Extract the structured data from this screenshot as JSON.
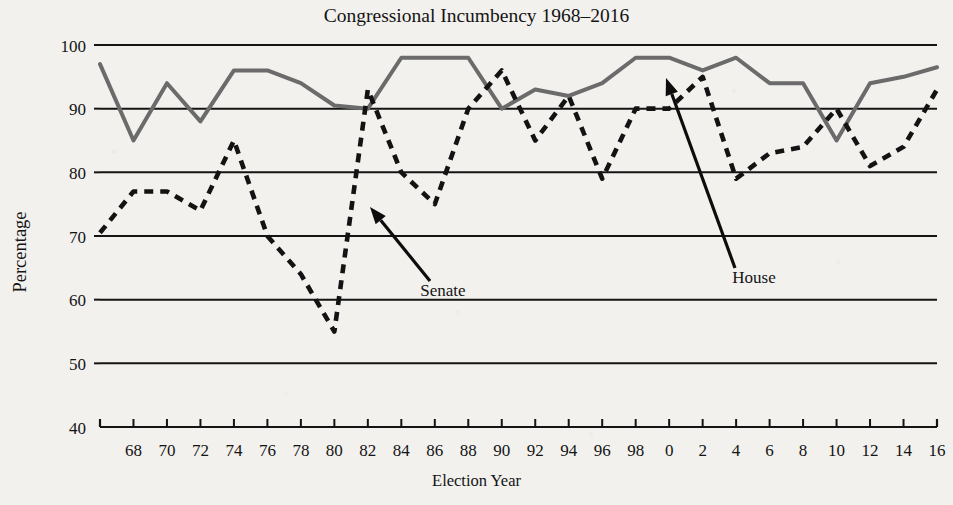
{
  "chart_data": {
    "type": "line",
    "title": "Congressional Incumbency 1968–2016",
    "xlabel": "Election Year",
    "ylabel": "Percentage",
    "ylim": [
      40,
      100
    ],
    "yticks": [
      40,
      50,
      60,
      70,
      80,
      90,
      100
    ],
    "ytick_labels": [
      "40",
      "50",
      "60",
      "70",
      "80",
      "90",
      "100"
    ],
    "grid": true,
    "legend_position": "inline-annotations",
    "xlim": [
      1966,
      2016
    ],
    "x": [
      1966,
      1968,
      1970,
      1972,
      1974,
      1976,
      1978,
      1980,
      1982,
      1984,
      1986,
      1988,
      1990,
      1992,
      1994,
      1996,
      1998,
      2000,
      2002,
      2004,
      2006,
      2008,
      2010,
      2012,
      2014,
      2016
    ],
    "xtick_values": [
      1968,
      1970,
      1972,
      1974,
      1976,
      1978,
      1980,
      1982,
      1984,
      1986,
      1988,
      1990,
      1992,
      1994,
      1996,
      1998,
      2000,
      2002,
      2004,
      2006,
      2008,
      2010,
      2012,
      2014,
      2016
    ],
    "xtick_labels": [
      "68",
      "70",
      "72",
      "74",
      "76",
      "78",
      "80",
      "82",
      "84",
      "86",
      "88",
      "90",
      "92",
      "94",
      "96",
      "98",
      "0",
      "2",
      "4",
      "6",
      "8",
      "10",
      "12",
      "14",
      "16"
    ],
    "series": [
      {
        "name": "House",
        "style": "solid",
        "color": "#6b6b6b",
        "values": [
          97,
          85,
          94,
          88,
          96,
          96,
          94,
          90.5,
          90,
          98,
          98,
          98,
          90,
          93,
          92,
          94,
          98,
          98,
          96,
          98,
          94,
          94,
          85,
          94,
          95,
          96.5
        ]
      },
      {
        "name": "Senate",
        "style": "dashed",
        "color": "#131313",
        "values": [
          70.5,
          77,
          77,
          74,
          85,
          70,
          64,
          55,
          93,
          80,
          75,
          90,
          96,
          85,
          92,
          79,
          90,
          90,
          95,
          79,
          83,
          84,
          90,
          81,
          84,
          93
        ]
      }
    ],
    "annotations": [
      {
        "text": "Senate",
        "label_x": 443,
        "label_y": 296,
        "tip_x": 370,
        "tip_y": 207,
        "tail_x": 430,
        "tail_y": 281
      },
      {
        "text": "House",
        "label_x": 754,
        "label_y": 283,
        "tip_x": 666,
        "tip_y": 78,
        "tail_x": 735,
        "tail_y": 268
      }
    ]
  }
}
